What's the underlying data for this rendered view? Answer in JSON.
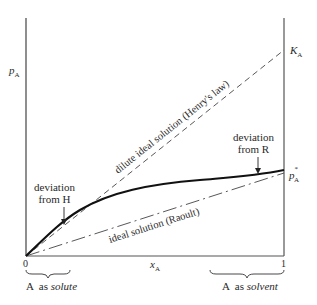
{
  "diagram": {
    "axes": {
      "y_label": "p",
      "y_label_sub": "A",
      "x_label": "x",
      "x_label_sub": "A",
      "x_tick_0": "0",
      "x_tick_1": "1"
    },
    "right_axis_labels": {
      "henry_constant": "K",
      "henry_constant_sub": "A",
      "pure_pressure": "p",
      "pure_pressure_sup": "*",
      "pure_pressure_sub": "A"
    },
    "lines": {
      "henry_line_label": "dilute ideal solution (Henry's law)",
      "raoult_line_label": "ideal solution (Raoult)"
    },
    "annotations": {
      "deviation_h_line1": "deviation",
      "deviation_h_line2": "from  H",
      "deviation_r_line1": "deviation",
      "deviation_r_line2": "from  R"
    },
    "braces": {
      "solute_prefix": "A  as ",
      "solute_word": "solute",
      "solvent_prefix": "A  as ",
      "solvent_word": "solvent"
    },
    "colors": {
      "ink": "#2a2a2a",
      "axis": "#555555"
    }
  }
}
